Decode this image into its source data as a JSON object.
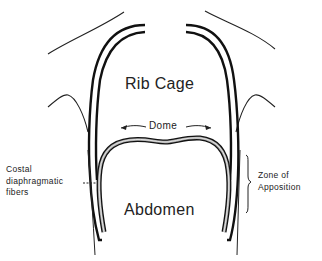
{
  "diagram": {
    "type": "anatomical-schematic",
    "labels": {
      "rib_cage": "Rib Cage",
      "dome": "Dome",
      "abdomen": "Abdomen",
      "costal_fibers": [
        "Costal",
        "diaphragmatic",
        "fibers"
      ],
      "zone_of_apposition": [
        "Zone of",
        "Apposition"
      ]
    },
    "colors": {
      "ink": "#111111",
      "text": "#222222",
      "diaphragm_fill": "#9a9a9a",
      "background": "#ffffff"
    }
  }
}
